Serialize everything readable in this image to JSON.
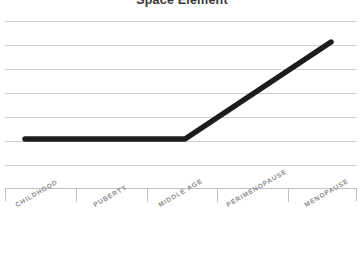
{
  "chart_data": {
    "type": "line",
    "title": "Space Element",
    "xlabel": "",
    "ylabel": "",
    "categories": [
      "CHILDHOOD",
      "PUBERTY",
      "MIDDLE AGE",
      "PERIMENOPAUSE",
      "MENOPAUSE"
    ],
    "series": [
      {
        "name": "Space Element",
        "values": [
          5,
          5,
          5,
          7.2,
          9.3
        ]
      }
    ],
    "ylim": [
      0,
      10
    ],
    "grid": true,
    "gridline_count": 7,
    "legend": "none",
    "line_color": "#1c1c1c",
    "line_width_px": 5.4,
    "gridline_color": "#cfcfcf",
    "axis_color": "#c2c2c2",
    "label_color": "#8c8c8c",
    "title_color": "#3a3a3a"
  },
  "geometry": {
    "gridline_y": [
      6,
      30,
      54,
      78,
      102,
      126,
      150
    ],
    "tick_x": [
      0,
      70.4,
      140.8,
      211.2,
      281.6,
      351
    ],
    "points": [
      {
        "x": 25,
        "y": 139
      },
      {
        "x": 185,
        "y": 139
      },
      {
        "x": 331,
        "y": 42
      }
    ],
    "label_positions": [
      {
        "x": 14,
        "y": 14
      },
      {
        "x": 92,
        "y": 14
      },
      {
        "x": 157,
        "y": 14
      },
      {
        "x": 225,
        "y": 14
      },
      {
        "x": 303,
        "y": 14
      }
    ]
  }
}
